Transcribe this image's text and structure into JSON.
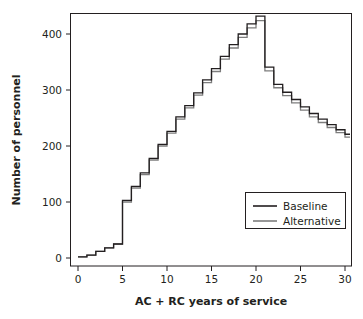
{
  "figure": {
    "background_color": "#ffffff",
    "clipped_title": "Number of personnel, by years of service"
  },
  "chart_data": {
    "type": "line",
    "subtype": "step",
    "title": "",
    "xlabel": "AC + RC years of service",
    "ylabel": "Number of personnel",
    "xlim": [
      0,
      31
    ],
    "ylim": [
      0,
      448
    ],
    "xticks": [
      0,
      5,
      10,
      15,
      20,
      25,
      30
    ],
    "xtick_labels": [
      "0",
      "5",
      "10",
      "15",
      "20",
      "25",
      "30"
    ],
    "yticks": [
      0,
      100,
      200,
      300,
      400
    ],
    "ytick_labels": [
      "0",
      "100",
      "200",
      "300",
      "400"
    ],
    "grid": false,
    "legend_position": "lower right",
    "x": [
      0,
      1,
      2,
      3,
      4,
      5,
      6,
      7,
      8,
      9,
      10,
      11,
      12,
      13,
      14,
      15,
      16,
      17,
      18,
      19,
      20,
      21,
      22,
      23,
      24,
      25,
      26,
      27,
      28,
      29,
      30
    ],
    "series": [
      {
        "name": "Baseline",
        "color": "#231f20",
        "values": [
          2,
          5,
          12,
          18,
          25,
          103,
          128,
          152,
          178,
          203,
          226,
          252,
          272,
          295,
          318,
          338,
          360,
          381,
          400,
          418,
          432,
          341,
          310,
          296,
          283,
          270,
          258,
          248,
          238,
          229,
          221
        ]
      },
      {
        "name": "Alternative",
        "color": "#7d7d7d",
        "values": [
          2,
          5,
          12,
          18,
          25,
          100,
          125,
          149,
          175,
          200,
          223,
          248,
          268,
          291,
          313,
          333,
          355,
          375,
          394,
          411,
          424,
          334,
          304,
          290,
          277,
          264,
          252,
          242,
          233,
          224,
          216
        ]
      }
    ]
  },
  "legend": {
    "entries": [
      {
        "label": "Baseline",
        "color": "#231f20"
      },
      {
        "label": "Alternative",
        "color": "#7d7d7d"
      }
    ]
  }
}
